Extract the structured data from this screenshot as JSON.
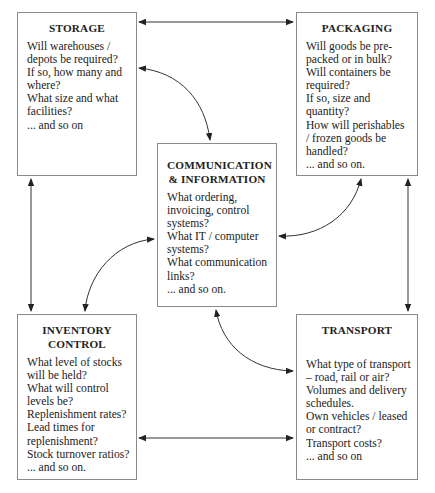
{
  "boxes": {
    "storage": {
      "title": [
        "STORAGE"
      ],
      "lines": [
        "Will warehouses /",
        "depots be required?",
        "If so, how many and",
        "where?",
        "What size and what",
        "facilities?",
        "... and so on"
      ]
    },
    "packaging": {
      "title": [
        "PACKAGING"
      ],
      "lines": [
        "Will goods be pre-",
        "packed or in bulk?",
        "Will containers be",
        "required?",
        "If so, size and",
        "quantity?",
        "How will perishables",
        "/ frozen goods be",
        "handled?",
        "... and so on."
      ]
    },
    "communication": {
      "title": [
        "COMMUNICATION",
        "& INFORMATION"
      ],
      "lines": [
        "What ordering,",
        "invoicing, control",
        "systems?",
        "What IT / computer",
        "systems?",
        "What communication",
        "links?",
        "... and so on."
      ]
    },
    "inventory": {
      "title": [
        "INVENTORY",
        "CONTROL"
      ],
      "lines": [
        "What level of stocks",
        "will be held?",
        "What will control",
        "levels be?",
        "Replenishment rates?",
        "Lead times for",
        "replenishment?",
        "Stock turnover ratios?",
        "... and so on."
      ]
    },
    "transport": {
      "title": [
        "TRANSPORT"
      ],
      "lines": [
        "What type of transport",
        "– road, rail or air?",
        "Volumes and delivery",
        "schedules.",
        "Own vehicles / leased",
        "or contract?",
        "Transport costs?",
        "... and so on"
      ]
    }
  },
  "connections": [
    {
      "from": "storage",
      "to": "packaging",
      "type": "straight",
      "bidirectional": true
    },
    {
      "from": "storage",
      "to": "inventory",
      "type": "straight",
      "bidirectional": true
    },
    {
      "from": "packaging",
      "to": "transport",
      "type": "straight",
      "bidirectional": true
    },
    {
      "from": "inventory",
      "to": "transport",
      "type": "straight",
      "bidirectional": true
    },
    {
      "from": "storage",
      "to": "communication",
      "type": "curved",
      "bidirectional": true
    },
    {
      "from": "packaging",
      "to": "communication",
      "type": "curved",
      "bidirectional": true
    },
    {
      "from": "inventory",
      "to": "communication",
      "type": "curved",
      "bidirectional": true
    },
    {
      "from": "transport",
      "to": "communication",
      "type": "curved",
      "bidirectional": true
    }
  ],
  "colors": {
    "line": "#333333",
    "border": "#8a8a8a",
    "text": "#222222"
  }
}
